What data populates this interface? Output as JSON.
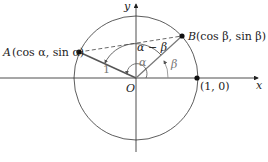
{
  "diagram": {
    "axis_x_label": "x",
    "axis_y_label": "y",
    "origin_label": "O",
    "point_A": {
      "name": "A",
      "coords": "(cos α, sin α)"
    },
    "point_B": {
      "name": "B",
      "coords": "(cos β, sin β)"
    },
    "point_unit": {
      "coords": "(1, 0)"
    },
    "radius_label": "1",
    "angle_alpha": "α",
    "angle_beta": "β",
    "angle_diff": "α − β",
    "colors": {
      "line": "#222222",
      "radius": "#555555",
      "angle": "#888888"
    }
  }
}
